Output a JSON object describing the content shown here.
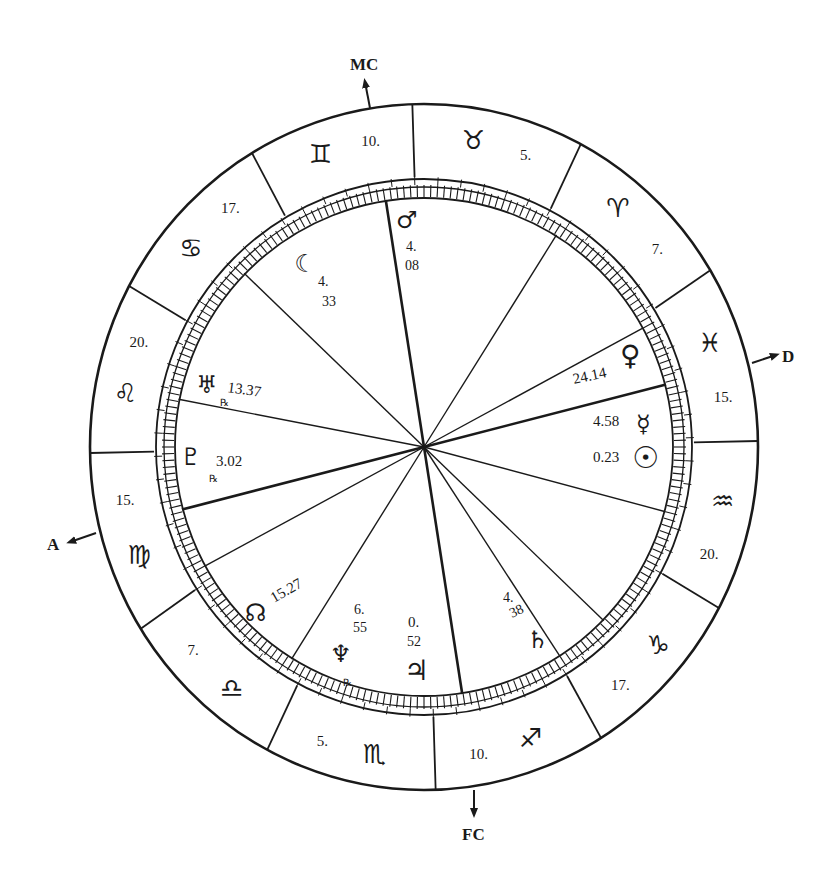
{
  "chart": {
    "title": "",
    "center": [
      424,
      447
    ],
    "radii": {
      "outer": 336,
      "sign_inner": 270,
      "mid": 262,
      "inner": 250
    },
    "axes": [
      {
        "id": "mc",
        "label": "MC",
        "angle": 98.8
      },
      {
        "id": "fc",
        "label": "FC",
        "angle": 278.8
      },
      {
        "id": "asc",
        "label": "A",
        "angle": 194.5
      },
      {
        "id": "desc",
        "label": "D",
        "angle": 14.5
      }
    ],
    "signs": [
      {
        "name": "taurus",
        "glyph": "♉",
        "cusp_degree": "5.",
        "start": 62,
        "end": 92
      },
      {
        "name": "gemini",
        "glyph": "♊",
        "cusp_degree": "10.",
        "start": 92,
        "end": 121
      },
      {
        "name": "cancer",
        "glyph": "♋",
        "cusp_degree": "17.",
        "start": 121,
        "end": 152
      },
      {
        "name": "leo",
        "glyph": "♌",
        "cusp_degree": "20.",
        "start": 152,
        "end": 181
      },
      {
        "name": "virgo",
        "glyph": "♍",
        "cusp_degree": "15.",
        "start": 181,
        "end": 212
      },
      {
        "name": "libra",
        "glyph": "♎",
        "cusp_degree": "7.",
        "start": 212,
        "end": 242
      },
      {
        "name": "scorpio",
        "glyph": "♏",
        "cusp_degree": "5.",
        "start": 242,
        "end": 272
      },
      {
        "name": "sagittarius",
        "glyph": "♐",
        "cusp_degree": "10.",
        "start": 272,
        "end": 302
      },
      {
        "name": "capricorn",
        "glyph": "♑",
        "cusp_degree": "17.",
        "start": 302,
        "end": 332
      },
      {
        "name": "aquarius",
        "glyph": "♒",
        "cusp_degree": "20.",
        "start": 332,
        "end": 361
      },
      {
        "name": "pisces",
        "glyph": "♓",
        "cusp_degree": "15.",
        "start": 1,
        "end": 31
      },
      {
        "name": "aries",
        "glyph": "♈",
        "cusp_degree": "7.",
        "start": 31,
        "end": 62
      }
    ],
    "house_lines": [
      98.8,
      136,
      169,
      194.5,
      208.5,
      238,
      278.8,
      303,
      316,
      345,
      14.5,
      28.5,
      58
    ],
    "heavy_lines": [
      98.8,
      278.8,
      194.5,
      14.5
    ],
    "planets": [
      {
        "name": "mars",
        "glyph": "♂",
        "position": "4.08",
        "pos_line1": "4.",
        "pos_line2": "08"
      },
      {
        "name": "moon",
        "glyph": "☽",
        "position": "4.33",
        "pos_line1": "4.",
        "pos_line2": "33"
      },
      {
        "name": "uranus",
        "glyph": "♅",
        "position": "13.37",
        "retrograde": true
      },
      {
        "name": "pluto",
        "glyph": "♇",
        "position": "3.02",
        "retrograde": true
      },
      {
        "name": "north-node",
        "glyph": "☊",
        "position": "15.27"
      },
      {
        "name": "neptune",
        "glyph": "♆",
        "position": "6.55",
        "pos_line1": "6.",
        "pos_line2": "55",
        "retrograde": true
      },
      {
        "name": "jupiter",
        "glyph": "♃",
        "position": "0.52",
        "pos_line1": "0.",
        "pos_line2": "52"
      },
      {
        "name": "saturn",
        "glyph": "♄",
        "position": "4.38",
        "pos_line1": "4.",
        "pos_line2": "38"
      },
      {
        "name": "venus",
        "glyph": "♀",
        "position": "24.14"
      },
      {
        "name": "mercury",
        "glyph": "☿",
        "position": "4.58"
      },
      {
        "name": "sun",
        "glyph": "☉",
        "position": "0.23"
      }
    ]
  }
}
